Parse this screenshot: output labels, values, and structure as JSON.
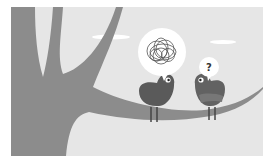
{
  "illustration": {
    "description": "Two birds on a tree branch talking",
    "colors": {
      "sky": "#e6e6e6",
      "tree": "#8c8c8c",
      "cloud": "#ffffff",
      "bird_left": "#5a5a5a",
      "bird_right": "#626262",
      "bubble": "#ffffff",
      "scribble": "#555555"
    },
    "bubble_left": {
      "content": "tangled-scribble"
    },
    "bubble_right": {
      "text": "?"
    }
  }
}
